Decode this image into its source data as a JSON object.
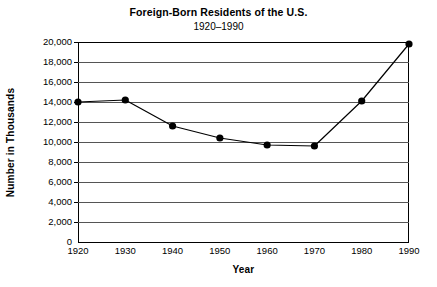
{
  "chart_data": {
    "type": "line",
    "title": "Foreign-Born Residents of the U.S.",
    "subtitle": "1920–1990",
    "xlabel": "Year",
    "ylabel": "Number in Thousands",
    "x": [
      1920,
      1930,
      1940,
      1950,
      1960,
      1970,
      1980,
      1990
    ],
    "categories": [
      "1920",
      "1930",
      "1940",
      "1950",
      "1960",
      "1970",
      "1980",
      "1990"
    ],
    "values": [
      14000,
      14200,
      11600,
      10400,
      9700,
      9600,
      14100,
      19800
    ],
    "series": [
      {
        "name": "Foreign-Born Residents",
        "values": [
          14000,
          14200,
          11600,
          10400,
          9700,
          9600,
          14100,
          19800
        ]
      }
    ],
    "xlim": [
      1920,
      1990
    ],
    "ylim": [
      0,
      20000
    ],
    "ytick_values": [
      0,
      2000,
      4000,
      6000,
      8000,
      10000,
      12000,
      14000,
      16000,
      18000,
      20000
    ],
    "ytick_labels": [
      "0",
      "2,000",
      "4,000",
      "6,000",
      "8,000",
      "10,000",
      "12,000",
      "14,000",
      "16,000",
      "18,000",
      "20,000"
    ],
    "xtick_values": [
      1920,
      1930,
      1940,
      1950,
      1960,
      1970,
      1980,
      1990
    ],
    "xtick_labels": [
      "1920",
      "1930",
      "1940",
      "1950",
      "1960",
      "1970",
      "1980",
      "1990"
    ],
    "grid": true,
    "grid_axis": "y",
    "legend": false,
    "legend_position": "none",
    "marker": "filled-circle",
    "line_color": "#000000",
    "marker_color": "#000000",
    "grid_color": "#555555",
    "axis_color": "#000000",
    "background_color": "#ffffff"
  }
}
